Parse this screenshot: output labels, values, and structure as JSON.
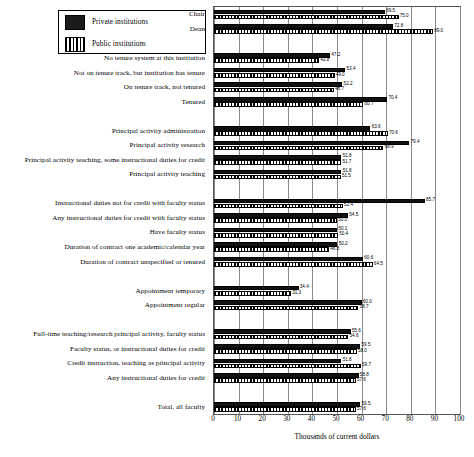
{
  "legend": {
    "items": [
      {
        "key": "private",
        "label": "Private institutions",
        "swatch": "solid-black"
      },
      {
        "key": "public",
        "label": "Public institutions",
        "swatch": "vertical-hatch"
      }
    ]
  },
  "axis": {
    "xlabel": "Thousands of current dollars",
    "ticks": [
      "0",
      "10",
      "20",
      "30",
      "40",
      "50",
      "60",
      "70",
      "80",
      "90",
      "100"
    ]
  },
  "chart_data": {
    "type": "bar",
    "orientation": "horizontal",
    "title": "",
    "xlabel": "Thousands of current dollars",
    "ylabel": "",
    "xlim": [
      0,
      100
    ],
    "grid": true,
    "legend_position": "top-left",
    "series": [
      {
        "name": "Private institutions",
        "color": "#111111"
      },
      {
        "name": "Public institutions",
        "color": "#ffffff"
      }
    ],
    "groups": [
      {
        "gap_after": true,
        "categories": [
          {
            "label": "Chair",
            "private": 69.5,
            "public": 75.0
          },
          {
            "label": "Dean",
            "private": 72.8,
            "public": 89.0
          }
        ]
      },
      {
        "gap_after": true,
        "categories": [
          {
            "label": "No tenure system at this institution",
            "private": 47.2,
            "public": 42.8
          },
          {
            "label": "Not on tenure track, but institution has tenure",
            "private": 53.4,
            "public": 49.0
          },
          {
            "label": "On tenure track, not tenured",
            "private": 52.2,
            "public": 48.7
          },
          {
            "label": "Tenured",
            "private": 70.4,
            "public": 60.7
          }
        ]
      },
      {
        "gap_after": true,
        "categories": [
          {
            "label": "Principal activity administration",
            "private": 63.6,
            "public": 70.6
          },
          {
            "label": "Principal activity research",
            "private": 79.4,
            "public": 68.9
          },
          {
            "label": "Principal activity teaching, some instructional duties for credit",
            "private": 51.8,
            "public": 51.7
          },
          {
            "label": "Principal activity teaching",
            "private": 51.8,
            "public": 51.5
          }
        ]
      },
      {
        "gap_after": true,
        "categories": [
          {
            "label": "Instructional duties not for credit with faculty status",
            "private": 85.7,
            "public": 52.4
          },
          {
            "label": "Any instructional duties for credit with faculty status",
            "private": 54.5,
            "public": 50.0
          },
          {
            "label": "Have faculty status",
            "private": 50.1,
            "public": 50.4
          },
          {
            "label": "Duration of contract one academic/calendar year",
            "private": 50.2,
            "public": 46.8
          },
          {
            "label": "Duration of contract unspecified or tenured",
            "private": 60.6,
            "public": 64.5
          }
        ]
      },
      {
        "gap_after": true,
        "categories": [
          {
            "label": "Appointment temporary",
            "private": 34.4,
            "public": 31.3
          },
          {
            "label": "Appointment regular",
            "private": 60.0,
            "public": 58.7
          }
        ]
      },
      {
        "gap_after": true,
        "categories": [
          {
            "label": "Full-time teaching/research principal activity, faculty status",
            "private": 55.6,
            "public": 54.6
          },
          {
            "label": "Faculty status, or instructional duties for credit",
            "private": 59.5,
            "public": 58.0
          },
          {
            "label": "Credit instruction, teaching as principal activity",
            "private": 51.8,
            "public": 59.7
          },
          {
            "label": "Any instructional duties for credit",
            "private": 58.8,
            "public": 57.6
          }
        ]
      },
      {
        "gap_after": false,
        "categories": [
          {
            "label": "Total, all faculty",
            "private": 59.5,
            "public": 57.6
          }
        ]
      }
    ]
  }
}
